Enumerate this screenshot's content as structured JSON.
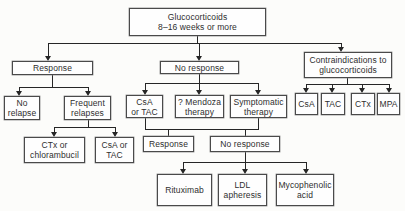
{
  "figure": {
    "type": "flowchart"
  },
  "colors": {
    "line": "#262626",
    "box_border": "#4a4a4a",
    "box_fill": "#fefefe",
    "text": "#2e2e2e",
    "background": "#fcfcfa"
  },
  "nodes": [
    {
      "id": "glucocorticoids",
      "lines": [
        "Glucocorticoids",
        "8–16 weeks or more"
      ]
    },
    {
      "id": "response-1",
      "lines": [
        "Response"
      ]
    },
    {
      "id": "no-response-1",
      "lines": [
        "No response"
      ]
    },
    {
      "id": "contraindications",
      "lines": [
        "Contraindications to",
        "glucocorticoids"
      ]
    },
    {
      "id": "no-relapse",
      "lines": [
        "No",
        "relapse"
      ]
    },
    {
      "id": "frequent-relapses",
      "lines": [
        "Frequent",
        "relapses"
      ]
    },
    {
      "id": "csa-or-tac-mid",
      "lines": [
        "CsA",
        "or TAC"
      ]
    },
    {
      "id": "mendoza-therapy",
      "lines": [
        "? Mendoza",
        "therapy"
      ]
    },
    {
      "id": "symptomatic-therapy",
      "lines": [
        "Symptomatic",
        "therapy"
      ]
    },
    {
      "id": "csa",
      "lines": [
        "CsA"
      ]
    },
    {
      "id": "tac",
      "lines": [
        "TAC"
      ]
    },
    {
      "id": "ctx",
      "lines": [
        "CTx"
      ]
    },
    {
      "id": "mpa",
      "lines": [
        "MPA"
      ]
    },
    {
      "id": "ctx-or-chlorambucil",
      "lines": [
        "CTx or",
        "chlorambucil"
      ]
    },
    {
      "id": "csa-or-tac-left",
      "lines": [
        "CsA or",
        "TAC"
      ]
    },
    {
      "id": "response-2",
      "lines": [
        "Response"
      ]
    },
    {
      "id": "no-response-2",
      "lines": [
        "No response"
      ]
    },
    {
      "id": "rituximab",
      "lines": [
        "Rituximab"
      ]
    },
    {
      "id": "ldl-apheresis",
      "lines": [
        "LDL",
        "apheresis"
      ]
    },
    {
      "id": "mycophenolic-acid",
      "lines": [
        "Mycophenolic",
        "acid"
      ]
    }
  ],
  "edges": [
    {
      "from": "glucocorticoids",
      "to": [
        "response-1",
        "no-response-1",
        "contraindications"
      ]
    },
    {
      "from": "response-1",
      "to": [
        "no-relapse",
        "frequent-relapses"
      ]
    },
    {
      "from": "frequent-relapses",
      "to": [
        "ctx-or-chlorambucil",
        "csa-or-tac-left"
      ]
    },
    {
      "from": "no-response-1",
      "to": [
        "csa-or-tac-mid",
        "mendoza-therapy",
        "symptomatic-therapy"
      ]
    },
    {
      "from": "csa-or-tac-mid + symptomatic-therapy",
      "to": [
        "response-2",
        "no-response-2"
      ]
    },
    {
      "from": "no-response-2",
      "to": [
        "rituximab",
        "ldl-apheresis",
        "mycophenolic-acid"
      ]
    },
    {
      "from": "contraindications",
      "to": [
        "csa",
        "tac",
        "ctx",
        "mpa"
      ]
    }
  ]
}
